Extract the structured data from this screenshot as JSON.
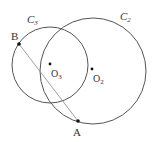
{
  "diagram": {
    "colors": {
      "stroke": "#555555",
      "chord": "#888888",
      "text": "#333333",
      "point": "#111111"
    },
    "circles": [
      {
        "id": "C3",
        "label": "C",
        "sub": "3",
        "cx": 50,
        "cy": 65,
        "r": 38
      },
      {
        "id": "C2",
        "label": "C",
        "sub": "2",
        "cx": 93,
        "cy": 71,
        "r": 53
      }
    ],
    "points": {
      "B": {
        "label": "B",
        "x": 19,
        "y": 44
      },
      "A": {
        "label": "A",
        "x": 78,
        "y": 121
      },
      "O3": {
        "label": "O",
        "sub": "3",
        "x": 50,
        "y": 64
      },
      "O2": {
        "label": "O",
        "sub": "2",
        "x": 92,
        "y": 69
      }
    },
    "segments": [
      {
        "from": "B",
        "to": "A"
      }
    ]
  }
}
